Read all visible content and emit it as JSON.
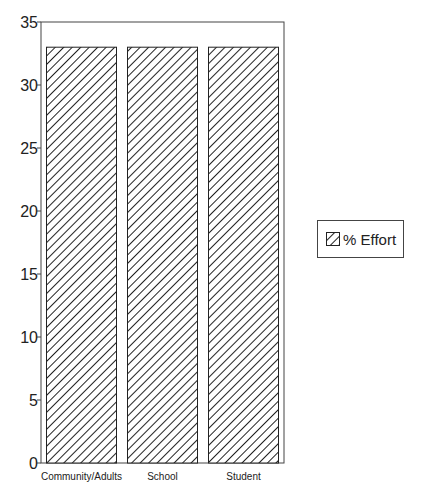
{
  "chart_data": {
    "type": "bar",
    "title": "",
    "xlabel": "",
    "ylabel": "",
    "categories": [
      "Community/Adults",
      "School",
      "Student"
    ],
    "series": [
      {
        "name": "% Effort",
        "values": [
          33,
          33,
          33
        ]
      }
    ],
    "ylim": [
      0,
      35
    ],
    "yticks": [
      0,
      5,
      10,
      15,
      20,
      25,
      30,
      35
    ],
    "grid": false,
    "legend_position": "right",
    "fill_pattern": "diagonal-hatch"
  },
  "legend": {
    "label": "% Effort"
  }
}
